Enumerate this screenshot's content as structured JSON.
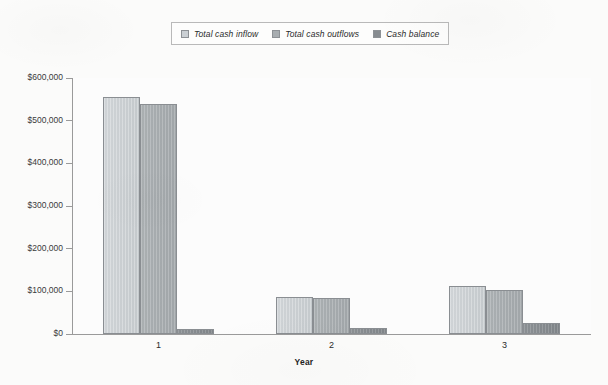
{
  "chart_data": {
    "type": "bar",
    "title": "",
    "subtitle": "",
    "xlabel": "Year",
    "ylabel": "",
    "categories": [
      "1",
      "2",
      "3"
    ],
    "series": [
      {
        "name": "Total cash inflow",
        "color": "#cbd0d4",
        "values": [
          555000,
          87000,
          112000
        ]
      },
      {
        "name": "Total cash outflows",
        "color": "#a8adb0",
        "values": [
          540000,
          85000,
          103000
        ]
      },
      {
        "name": "Cash balance",
        "color": "#878c90",
        "values": [
          12000,
          15000,
          25000
        ]
      }
    ],
    "ylim": [
      0,
      600000
    ],
    "ytick_labels": [
      "$0",
      "$100,000",
      "$200,000",
      "$300,000",
      "$400,000",
      "$500,000",
      "$600,000"
    ],
    "ytick_values": [
      0,
      100000,
      200000,
      300000,
      400000,
      500000,
      600000
    ],
    "grid": false,
    "legend_position": "top-center",
    "legend_italic": true,
    "annotations": []
  },
  "legend": {
    "items": [
      {
        "label": "Total cash inflow"
      },
      {
        "label": "Total cash outflows"
      },
      {
        "label": "Cash balance"
      }
    ]
  },
  "colors": {
    "series_1": "#cbd0d4",
    "series_2": "#a8adb0",
    "series_3": "#878c90",
    "axis": "#9a9a9a",
    "text": "#2b2b2b",
    "background": "#fbfbfa"
  }
}
